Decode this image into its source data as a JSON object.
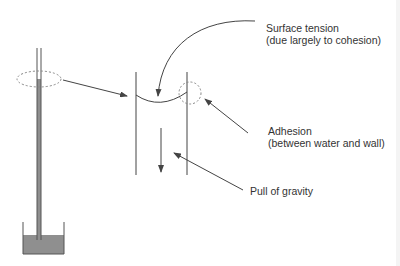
{
  "diagram": {
    "type": "capillary-action",
    "colors": {
      "line": "#444444",
      "water": "#8f8f8f",
      "dashed": "#777777",
      "background": "#ffffff"
    },
    "labels": {
      "surface_tension": {
        "line1": "Surface tension",
        "line2": "(due largely to cohesion)"
      },
      "adhesion": {
        "line1": "Adhesion",
        "line2": "(between water and wall)"
      },
      "gravity": {
        "line1": "Pull of gravity"
      }
    }
  }
}
